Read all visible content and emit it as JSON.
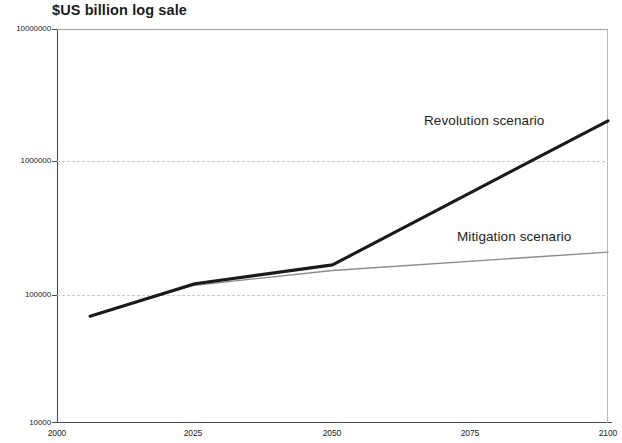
{
  "chart_data": {
    "type": "line",
    "title": "$US billion log sale",
    "xlabel": "",
    "ylabel": "$US billion log sale",
    "yscale": "log",
    "xlim": [
      2000,
      2100
    ],
    "ylim": [
      10000,
      10000000
    ],
    "grid": true,
    "legend_position": "inline-annotations",
    "x_ticks": [
      "2000",
      "2025",
      "2050",
      "2075",
      "2100"
    ],
    "y_ticks": [
      "10000000",
      "1000000",
      "100000",
      "10000"
    ],
    "series": [
      {
        "name": "Revolution scenario",
        "color": "#1a1a1a",
        "x": [
          2006,
          2025,
          2050,
          2100
        ],
        "values": [
          65000,
          115000,
          160000,
          2000000
        ]
      },
      {
        "name": "Mitigation scenario",
        "color": "#8a8a8a",
        "x": [
          2006,
          2025,
          2050,
          2100
        ],
        "values": [
          65000,
          112000,
          145000,
          200000
        ]
      }
    ],
    "annotations": [
      {
        "text": "Revolution scenario",
        "x": 2075,
        "y": 2400000
      },
      {
        "text": "Mitigation scenario",
        "x": 2082,
        "y": 330000
      }
    ]
  },
  "axes": {
    "y_tick_labels": [
      "10000000",
      "1000000",
      "100000",
      "10000"
    ],
    "x_tick_labels": [
      "2000",
      "2025",
      "2050",
      "2075",
      "2100"
    ]
  },
  "labels": {
    "title": "$US billion log sale",
    "revolution": "Revolution scenario",
    "mitigation": "Mitigation scenario"
  }
}
